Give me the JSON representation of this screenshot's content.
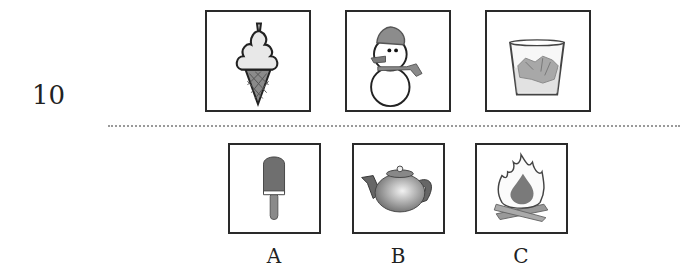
{
  "question": {
    "number": "10"
  },
  "prompt_images": [
    {
      "id": "ice-cream-cone",
      "icon": "ice-cream-cone-icon"
    },
    {
      "id": "snowman",
      "icon": "snowman-icon"
    },
    {
      "id": "glass-of-ice",
      "icon": "glass-of-ice-icon"
    }
  ],
  "options": [
    {
      "label": "A",
      "icon": "popsicle-icon"
    },
    {
      "label": "B",
      "icon": "teapot-icon"
    },
    {
      "label": "C",
      "icon": "campfire-icon"
    }
  ]
}
